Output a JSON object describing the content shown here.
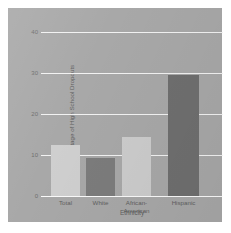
{
  "chart_data": {
    "type": "bar",
    "title": "",
    "xlabel": "Ethnicity",
    "ylabel": "Percentage of High School Dropouts",
    "categories": [
      "Total",
      "White",
      "African-\nAmerican",
      "Hispanic"
    ],
    "values": [
      12.5,
      9.3,
      14.5,
      29.5
    ],
    "yticks": [
      "0",
      "10",
      "20",
      "30",
      "40"
    ],
    "ytick_values": [
      0,
      10,
      20,
      30,
      40
    ],
    "ylim": [
      0,
      40
    ],
    "grid": "horizontal",
    "legend": "none",
    "bar_colors": [
      "#cfcfcf",
      "#7c7c7c",
      "#cccccc",
      "#6f6f6f"
    ]
  },
  "style": {
    "panel_background": "#a8a8a8",
    "figure_background": "#ffffff",
    "gridline_color": "#f2f2f2",
    "tick_text_color": "#6e6e6e",
    "axis_label_color": "#5f5f5f"
  }
}
